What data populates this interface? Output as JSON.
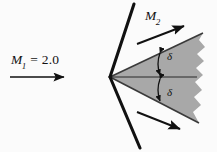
{
  "figure": {
    "width": 217,
    "height": 152,
    "background_color": "#fbfbfb",
    "line_color": "#111111",
    "shaded_fill_color": "#a8a8a8",
    "shaded_edge_color": "#3a3a3a"
  },
  "labels": {
    "upstream_mach": {
      "symbol": "M",
      "subscript": "1",
      "equals": " = ",
      "value": "2.0",
      "full_text": "M1 = 2.0"
    },
    "downstream_mach": {
      "symbol": "M",
      "subscript": "2",
      "full_text": "M2"
    },
    "deflection_upper": "δ",
    "deflection_lower": "δ"
  },
  "arrows": {
    "upstream_flow": {
      "name": "upstream-flow-arrow",
      "x1": 10,
      "y1": 77,
      "x2": 68,
      "y2": 77
    },
    "upper_downstream_flow": {
      "name": "upper-downstream-flow-arrow",
      "x1": 137,
      "y1": 44,
      "x2": 188,
      "y2": 25
    },
    "lower_downstream_flow": {
      "name": "lower-downstream-flow-arrow",
      "x1": 137,
      "y1": 112,
      "x2": 184,
      "y2": 131
    }
  },
  "geometry": {
    "apex": {
      "x": 110,
      "y": 77
    },
    "upper_shock": {
      "x1": 110,
      "y1": 77,
      "x2": 134,
      "y2": 4
    },
    "lower_shock": {
      "x1": 110,
      "y1": 77,
      "x2": 140,
      "y2": 148
    },
    "centerline": {
      "x1": 110,
      "y1": 77,
      "x2": 197,
      "y2": 77
    },
    "wedge_upper_edge": {
      "x1": 110,
      "y1": 77,
      "x2": 203,
      "y2": 33
    },
    "wedge_lower_edge": {
      "x1": 110,
      "y1": 77,
      "x2": 199,
      "y2": 123
    }
  },
  "annotations": {
    "delta_arc_upper": "curved double-headed arrow between wedge upper surface and centerline",
    "delta_arc_lower": "curved double-headed arrow between centerline and wedge lower surface"
  }
}
